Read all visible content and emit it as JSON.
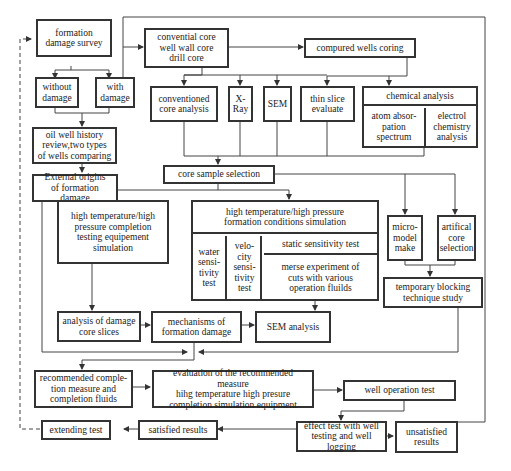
{
  "diagram": {
    "type": "flowchart",
    "nodes": {
      "survey": "formation\ndamage survey",
      "without_damage": "without\ndamage",
      "with_damage": "with\ndamage",
      "history_review": "oil well history\nreview,two types\nof wells comparing",
      "external_origins": "External origins\nof formation damage",
      "core_types": "convential core\nwell wall core\ndrill core",
      "compared_wells": "compured wells coring",
      "conventional_analysis": "conventioned\ncore analysis",
      "xray": "X-\nRay",
      "sem": "SEM",
      "thin_slice": "thin slice\nevaluate",
      "chemical_analysis": "chemical analysis",
      "atom_absorption": "atom absor-\npation\nspectrum",
      "electrochemistry": "electrol\nchemistry\nanalysis",
      "core_sample_selection": "core sample selection",
      "hthp_completion_sim": "high temperature/high\npressure completion\ntesting equipement\nsimulation",
      "hthp_formation_sim": "high temperature/high pressure\nformation conditions simulation",
      "water_sensitivity": "water\nsensi-\ntivity\ntest",
      "velocity_sensitivity": "velo-\ncity\nsensi-\ntivity\ntest",
      "static_sensitivity": "static sensitivity test",
      "merse_experiment": "merse experiment of\ncuts with various\noperation fluilds",
      "micro_model": "micro-\nmodel\nmake",
      "artificial_core": "artifical\ncore\nselection",
      "temporary_blocking": "temporary blocking\ntechnique study",
      "analysis_slices": "analysis of damage\ncore slices",
      "mechanisms": "mechanisms of\nformation damage",
      "sem_analysis": "SEM analysis",
      "recommended_completion": "recommended comple-\ntion measure and\ncompletion fluids",
      "evaluation": "evaluation of the recommended measure\nhihg temperature high presure\ncompletion simulation equipment",
      "well_operation_test": "well operation test",
      "effect_test": "effect test with well\ntesting and well logging",
      "unsatisfied": "unsatisfied\nresults",
      "satisfied": "satisfied results",
      "extending_test": "extending test"
    },
    "edges": [
      [
        "survey",
        "without_damage"
      ],
      [
        "survey",
        "with_damage"
      ],
      [
        "without_damage",
        "history_review"
      ],
      [
        "with_damage",
        "history_review"
      ],
      [
        "with_damage",
        "core_types"
      ],
      [
        "history_review",
        "external_origins"
      ],
      [
        "core_types",
        "compared_wells"
      ],
      [
        "core_types",
        "conventional_analysis"
      ],
      [
        "core_types",
        "xray"
      ],
      [
        "core_types",
        "sem"
      ],
      [
        "core_types",
        "thin_slice"
      ],
      [
        "compared_wells",
        "thin_slice"
      ],
      [
        "compared_wells",
        "chemical_analysis"
      ],
      [
        "analyses",
        "core_sample_selection"
      ],
      [
        "core_sample_selection",
        "hthp_completion_sim"
      ],
      [
        "core_sample_selection",
        "hthp_formation_sim"
      ],
      [
        "core_sample_selection",
        "micro_model"
      ],
      [
        "core_sample_selection",
        "artificial_core"
      ],
      [
        "micro_model",
        "temporary_blocking"
      ],
      [
        "artificial_core",
        "temporary_blocking"
      ],
      [
        "hthp_completion_sim",
        "analysis_slices"
      ],
      [
        "analysis_slices",
        "mechanisms"
      ],
      [
        "mechanisms",
        "sem_analysis"
      ],
      [
        "hthp_formation_sim",
        "sem_analysis"
      ],
      [
        "external_origins",
        "merge"
      ],
      [
        "temporary_blocking",
        "merge"
      ],
      [
        "merge",
        "recommended_completion"
      ],
      [
        "recommended_completion",
        "evaluation"
      ],
      [
        "evaluation",
        "well_operation_test"
      ],
      [
        "well_operation_test",
        "effect_test"
      ],
      [
        "effect_test",
        "unsatisfied"
      ],
      [
        "unsatisfied",
        "with_damage"
      ],
      [
        "effect_test",
        "satisfied"
      ],
      [
        "satisfied",
        "extending_test"
      ],
      [
        "extending_test",
        "survey",
        "dashed"
      ]
    ]
  }
}
